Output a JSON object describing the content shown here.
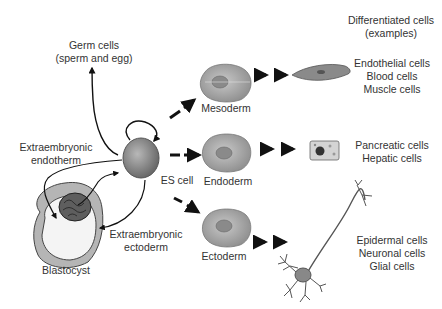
{
  "header": {
    "differentiated_title_line1": "Differentiated cells",
    "differentiated_title_line2": "(examples)"
  },
  "nodes": {
    "germ_cells": {
      "line1": "Germ cells",
      "line2": "(sperm and egg)"
    },
    "extraembryonic_endotherm": {
      "line1": "Extraembryonic",
      "line2": "endotherm"
    },
    "extraembryonic_ectoderm": {
      "line1": "Extraembryonic",
      "line2": "ectoderm"
    },
    "blastocyst": {
      "label": "Blastocyst"
    },
    "es_cell": {
      "label": "ES cell"
    },
    "mesoderm": {
      "label": "Mesoderm"
    },
    "endoderm": {
      "label": "Endoderm"
    },
    "ectoderm": {
      "label": "Ectoderm"
    }
  },
  "outcomes": {
    "mesoderm": [
      "Endothelial cells",
      "Blood cells",
      "Muscle cells"
    ],
    "endoderm": [
      "Pancreatic cells",
      "Hepatic cells"
    ],
    "ectoderm": [
      "Epidermal cells",
      "Neuronal cells",
      "Glial cells"
    ]
  },
  "colors": {
    "text": "#333333",
    "arrow": "#111111",
    "cell_fill": "#9a9a9a",
    "cell_light": "#c4c4c4",
    "blastocyst_ring": "#b5b5b5",
    "icm_fill": "#5e5e5e"
  }
}
